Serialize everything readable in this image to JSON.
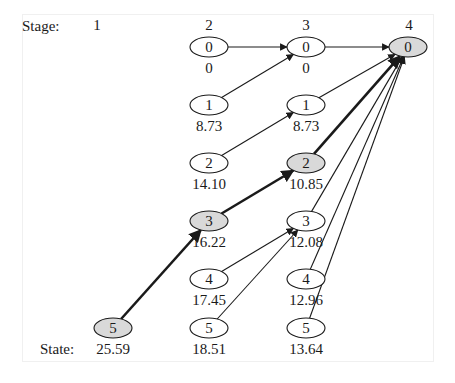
{
  "diagram": {
    "stage_label": "Stage:",
    "state_label": "State:",
    "stages": [
      {
        "id": 1,
        "label": "1",
        "x": 97,
        "y": 30
      },
      {
        "id": 2,
        "label": "2",
        "x": 209,
        "y": 30
      },
      {
        "id": 3,
        "label": "3",
        "x": 306,
        "y": 30
      },
      {
        "id": 4,
        "label": "4",
        "x": 409,
        "y": 30
      }
    ],
    "nodes": [
      {
        "id": "s1n5",
        "stage": 1,
        "state": "5",
        "value": "25.59",
        "x": 113,
        "y": 328,
        "highlighted": true
      },
      {
        "id": "s2n0",
        "stage": 2,
        "state": "0",
        "value": "0",
        "x": 209,
        "y": 47,
        "highlighted": false
      },
      {
        "id": "s2n1",
        "stage": 2,
        "state": "1",
        "value": "8.73",
        "x": 209,
        "y": 105,
        "highlighted": false
      },
      {
        "id": "s2n2",
        "stage": 2,
        "state": "2",
        "value": "14.10",
        "x": 209,
        "y": 163,
        "highlighted": false
      },
      {
        "id": "s2n3",
        "stage": 2,
        "state": "3",
        "value": "16.22",
        "x": 209,
        "y": 221,
        "highlighted": true
      },
      {
        "id": "s2n4",
        "stage": 2,
        "state": "4",
        "value": "17.45",
        "x": 209,
        "y": 279,
        "highlighted": false
      },
      {
        "id": "s2n5",
        "stage": 2,
        "state": "5",
        "value": "18.51",
        "x": 209,
        "y": 328,
        "highlighted": false
      },
      {
        "id": "s3n0",
        "stage": 3,
        "state": "0",
        "value": "0",
        "x": 306,
        "y": 47,
        "highlighted": false
      },
      {
        "id": "s3n1",
        "stage": 3,
        "state": "1",
        "value": "8.73",
        "x": 306,
        "y": 105,
        "highlighted": false
      },
      {
        "id": "s3n2",
        "stage": 3,
        "state": "2",
        "value": "10.85",
        "x": 306,
        "y": 163,
        "highlighted": true
      },
      {
        "id": "s3n3",
        "stage": 3,
        "state": "3",
        "value": "12.08",
        "x": 306,
        "y": 221,
        "highlighted": false
      },
      {
        "id": "s3n4",
        "stage": 3,
        "state": "4",
        "value": "12.96",
        "x": 306,
        "y": 279,
        "highlighted": false
      },
      {
        "id": "s3n5",
        "stage": 3,
        "state": "5",
        "value": "13.64",
        "x": 306,
        "y": 328,
        "highlighted": false
      },
      {
        "id": "s4n0",
        "stage": 4,
        "state": "0",
        "value": "",
        "x": 408,
        "y": 47,
        "highlighted": true
      }
    ],
    "edges": [
      {
        "from": "s1n5",
        "to": "s2n3",
        "bold": true
      },
      {
        "from": "s2n0",
        "to": "s3n0",
        "bold": false
      },
      {
        "from": "s2n1",
        "to": "s3n0",
        "bold": false
      },
      {
        "from": "s2n2",
        "to": "s3n1",
        "bold": false
      },
      {
        "from": "s2n3",
        "to": "s3n2",
        "bold": true
      },
      {
        "from": "s2n4",
        "to": "s3n3",
        "bold": false
      },
      {
        "from": "s2n5",
        "to": "s3n3",
        "bold": false
      },
      {
        "from": "s3n0",
        "to": "s4n0",
        "bold": false
      },
      {
        "from": "s3n1",
        "to": "s4n0",
        "bold": false
      },
      {
        "from": "s3n2",
        "to": "s4n0",
        "bold": true
      },
      {
        "from": "s3n3",
        "to": "s4n0",
        "bold": false
      },
      {
        "from": "s3n4",
        "to": "s4n0",
        "bold": false
      },
      {
        "from": "s3n5",
        "to": "s4n0",
        "bold": false
      }
    ],
    "colors": {
      "highlight_fill": "#d9d9d9",
      "node_fill": "#ffffff",
      "stroke": "#1a1a1a"
    }
  }
}
